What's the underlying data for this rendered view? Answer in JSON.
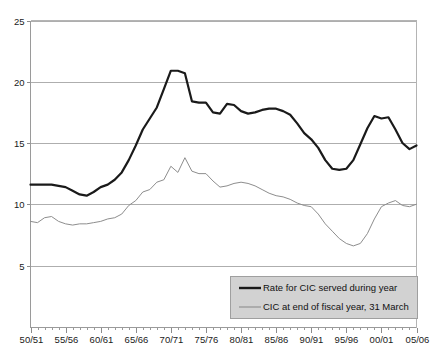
{
  "chart_data": {
    "type": "line",
    "title": "",
    "xlabel": "",
    "ylabel": "",
    "ylim": [
      0,
      25
    ],
    "yticks": [
      5,
      10,
      15,
      20,
      25
    ],
    "ytick_labels": [
      "5",
      "10",
      "15",
      "20",
      "25"
    ],
    "grid": true,
    "legend_position": "bottom-right",
    "categories": [
      "50/51",
      "51/52",
      "52/53",
      "53/54",
      "54/55",
      "55/56",
      "56/57",
      "57/58",
      "58/59",
      "59/60",
      "60/61",
      "61/62",
      "62/63",
      "63/64",
      "64/65",
      "65/66",
      "66/67",
      "67/68",
      "68/69",
      "69/70",
      "70/71",
      "71/72",
      "72/73",
      "73/74",
      "74/75",
      "75/76",
      "76/77",
      "77/78",
      "78/79",
      "79/80",
      "80/81",
      "81/82",
      "82/83",
      "83/84",
      "84/85",
      "85/86",
      "86/87",
      "87/88",
      "88/89",
      "89/90",
      "90/91",
      "91/92",
      "92/93",
      "93/94",
      "94/95",
      "95/96",
      "96/97",
      "97/98",
      "98/99",
      "99/00",
      "00/01",
      "01/02",
      "02/03",
      "03/04",
      "04/05",
      "05/06"
    ],
    "xtick_labels": [
      "50/51",
      "55/56",
      "60/61",
      "65/66",
      "70/71",
      "75/76",
      "80/81",
      "85/86",
      "90/91",
      "95/96",
      "00/01",
      "05/06"
    ],
    "series": [
      {
        "name": "Rate for CIC served during year",
        "color": "#1a1a1a",
        "style": "thick",
        "values": [
          11.6,
          11.6,
          11.6,
          11.6,
          11.5,
          11.4,
          11.1,
          10.8,
          10.7,
          11.0,
          11.4,
          11.6,
          12.0,
          12.6,
          13.6,
          14.8,
          16.1,
          17.0,
          17.9,
          19.4,
          20.9,
          20.9,
          20.7,
          18.4,
          18.3,
          18.3,
          17.5,
          17.4,
          18.2,
          18.1,
          17.6,
          17.4,
          17.5,
          17.7,
          17.8,
          17.8,
          17.6,
          17.3,
          16.6,
          15.8,
          15.3,
          14.6,
          13.6,
          12.9,
          12.8,
          12.9,
          13.6,
          14.9,
          16.2,
          17.2,
          17.0,
          17.1,
          16.1,
          15.0,
          14.5,
          14.8
        ]
      },
      {
        "name": "CIC at end of fiscal year, 31 March",
        "color": "#8d8d8d",
        "style": "thin",
        "values": [
          8.6,
          8.5,
          8.9,
          9.0,
          8.6,
          8.4,
          8.3,
          8.4,
          8.4,
          8.5,
          8.6,
          8.8,
          8.9,
          9.2,
          9.9,
          10.3,
          11.0,
          11.2,
          11.8,
          12.0,
          13.1,
          12.6,
          13.8,
          12.7,
          12.5,
          12.5,
          11.9,
          11.4,
          11.5,
          11.7,
          11.8,
          11.7,
          11.5,
          11.2,
          10.9,
          10.7,
          10.6,
          10.4,
          10.1,
          9.9,
          9.8,
          9.2,
          8.4,
          7.8,
          7.2,
          6.8,
          6.6,
          6.8,
          7.6,
          8.8,
          9.8,
          10.1,
          10.3,
          9.9,
          9.8,
          10.0
        ]
      }
    ],
    "legend": [
      {
        "label": "Rate for CIC served during year",
        "marker": "thick-line",
        "color": "#1a1a1a"
      },
      {
        "label": "CIC at end of fiscal year, 31 March",
        "marker": "thin-line",
        "color": "#8d8d8d"
      }
    ]
  }
}
